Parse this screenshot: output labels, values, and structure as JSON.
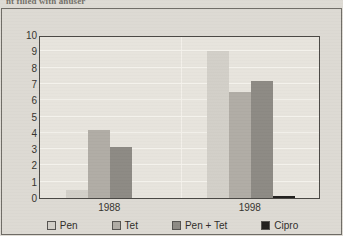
{
  "caption_fragment": "nt filled with anuser",
  "colors": {
    "page_background": "#dedbd4",
    "plot_background": "#e7e4dd",
    "frame_border": "#4b4945",
    "gridline": "#f4f2ec",
    "text": "#35332f",
    "pen": "#d2cfc8",
    "tet": "#b0aca5",
    "pen_tet": "#8d8a84",
    "cipro": "#211f1d"
  },
  "legend": {
    "position": "bottom",
    "items": [
      {
        "label": "Pen",
        "color": "#d2cfc8"
      },
      {
        "label": "Tet",
        "color": "#b0aca5"
      },
      {
        "label": "Pen + Tet",
        "color": "#8d8a84"
      },
      {
        "label": "Cipro",
        "color": "#211f1d"
      }
    ]
  },
  "yaxis": {
    "label": "Percent resistant",
    "min": 0,
    "max": 10,
    "ticks": [
      10,
      9,
      8,
      7,
      6,
      5,
      4,
      3,
      2,
      1,
      0
    ]
  },
  "xaxis": {
    "label": "",
    "categories": [
      "1988",
      "1998"
    ]
  },
  "chart_data": {
    "type": "bar",
    "title": "",
    "subtitle": "",
    "xlabel": "",
    "ylabel": "Percent resistant",
    "ylim": [
      0,
      10
    ],
    "grid": true,
    "legend_position": "bottom",
    "categories": [
      "1988",
      "1998"
    ],
    "series": [
      {
        "name": "Pen",
        "color": "#d2cfc8",
        "values": [
          0.5,
          9.0
        ]
      },
      {
        "name": "Tet",
        "color": "#b0aca5",
        "values": [
          4.2,
          6.5
        ]
      },
      {
        "name": "Pen + Tet",
        "color": "#8d8a84",
        "values": [
          3.1,
          7.2
        ]
      },
      {
        "name": "Cipro",
        "color": "#211f1d",
        "values": [
          0.0,
          0.1
        ]
      }
    ]
  }
}
